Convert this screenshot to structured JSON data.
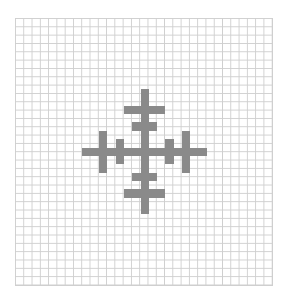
{
  "board": {
    "cols": 31,
    "rows": 32,
    "cell_w": 8.29,
    "cell_h": 8.34,
    "center_px": [
      140.5,
      147.5
    ],
    "line_color": "#cfcfcf",
    "fill_color": "#8a8a8a",
    "background": "#ffffff"
  },
  "pattern": {
    "description": "symmetric cross / snowflake of filled cells, offsets relative to center cell",
    "cells": [
      [
        -7,
        0
      ],
      [
        -6,
        0
      ],
      [
        -5,
        0
      ],
      [
        -4,
        0
      ],
      [
        -3,
        0
      ],
      [
        -2,
        0
      ],
      [
        -1,
        0
      ],
      [
        0,
        0
      ],
      [
        1,
        0
      ],
      [
        2,
        0
      ],
      [
        3,
        0
      ],
      [
        4,
        0
      ],
      [
        5,
        0
      ],
      [
        6,
        0
      ],
      [
        7,
        0
      ],
      [
        0,
        -7
      ],
      [
        0,
        -6
      ],
      [
        0,
        -5
      ],
      [
        0,
        -4
      ],
      [
        0,
        -3
      ],
      [
        0,
        -2
      ],
      [
        0,
        -1
      ],
      [
        0,
        1
      ],
      [
        0,
        2
      ],
      [
        0,
        3
      ],
      [
        0,
        4
      ],
      [
        0,
        5
      ],
      [
        0,
        6
      ],
      [
        0,
        7
      ],
      [
        -2,
        -5
      ],
      [
        -1,
        -5
      ],
      [
        1,
        -5
      ],
      [
        2,
        -5
      ],
      [
        -1,
        -3
      ],
      [
        1,
        -3
      ],
      [
        -2,
        5
      ],
      [
        -1,
        5
      ],
      [
        1,
        5
      ],
      [
        2,
        5
      ],
      [
        -1,
        3
      ],
      [
        1,
        3
      ],
      [
        -5,
        -2
      ],
      [
        -5,
        -1
      ],
      [
        -5,
        1
      ],
      [
        -5,
        2
      ],
      [
        -3,
        -1
      ],
      [
        -3,
        1
      ],
      [
        5,
        -2
      ],
      [
        5,
        -1
      ],
      [
        5,
        1
      ],
      [
        5,
        2
      ],
      [
        3,
        -1
      ],
      [
        3,
        1
      ]
    ]
  }
}
